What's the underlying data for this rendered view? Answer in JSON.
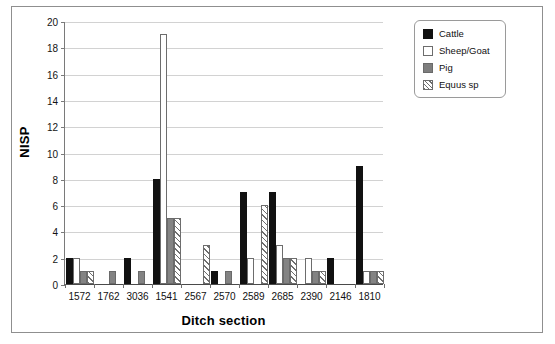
{
  "chart_data": {
    "type": "bar",
    "title": "",
    "xlabel": "Ditch section",
    "ylabel": "NISP",
    "ylim": [
      0,
      20
    ],
    "ytick_step": 2,
    "yticks": [
      0,
      2,
      4,
      6,
      8,
      10,
      12,
      14,
      16,
      18,
      20
    ],
    "grid": "horizontal",
    "legend_position": "right-outside",
    "categories": [
      "1572",
      "1762",
      "3036",
      "1541",
      "2567",
      "2570",
      "2589",
      "2685",
      "2390",
      "2146",
      "1810"
    ],
    "series": [
      {
        "name": "Cattle",
        "color": "#111111",
        "fill": "solid",
        "values": [
          2,
          0,
          2,
          8,
          0,
          1,
          7,
          7,
          0,
          2,
          9
        ]
      },
      {
        "name": "Sheep/Goat",
        "color": "#ffffff",
        "fill": "open",
        "values": [
          2,
          0,
          0,
          19,
          0,
          0,
          2,
          3,
          2,
          0,
          1
        ]
      },
      {
        "name": "Pig",
        "color": "#838383",
        "fill": "gray",
        "values": [
          1,
          1,
          1,
          5,
          0,
          1,
          0,
          2,
          1,
          0,
          1
        ]
      },
      {
        "name": "Equus sp",
        "color": "#6f6f6f",
        "fill": "hatch",
        "values": [
          1,
          0,
          0,
          5,
          3,
          0,
          6,
          2,
          1,
          0,
          1
        ]
      }
    ]
  },
  "legend": {
    "items": [
      {
        "label": "Cattle",
        "swatch": "black-square-icon"
      },
      {
        "label": "Sheep/Goat",
        "swatch": "white-square-icon"
      },
      {
        "label": "Pig",
        "swatch": "gray-square-icon"
      },
      {
        "label": "Equus sp",
        "swatch": "hatched-square-icon"
      }
    ]
  },
  "axes": {
    "y_title": "NISP",
    "x_title": "Ditch section",
    "y_tick_labels": [
      "0",
      "2",
      "4",
      "6",
      "8",
      "10",
      "12",
      "14",
      "16",
      "18",
      "20"
    ],
    "x_tick_labels": [
      "1572",
      "1762",
      "3036",
      "1541",
      "2567",
      "2570",
      "2589",
      "2685",
      "2390",
      "2146",
      "1810"
    ]
  }
}
